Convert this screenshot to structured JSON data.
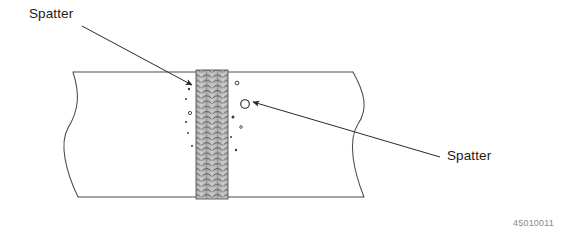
{
  "figure": {
    "id_number": "45010011",
    "colors": {
      "line": "#4a4a4a",
      "bead_fill": "#c9c9c9",
      "bead_dark": "#6f6f6f",
      "spatter": "#3a3a3a",
      "label_text": "#1a1a1a",
      "id_text": "#8a8a8a",
      "background": "#ffffff"
    },
    "callouts": [
      {
        "name": "spatter-top",
        "label": "Spatter",
        "label_x": 29,
        "label_y": 6,
        "leader_from_x": 82,
        "leader_from_y": 26,
        "leader_to_x": 192,
        "leader_to_y": 85
      },
      {
        "name": "spatter-bottom",
        "label": "Spatter",
        "label_x": 447,
        "label_y": 148,
        "leader_from_x": 440,
        "leader_from_y": 157,
        "leader_to_x": 245,
        "leader_to_y": 104
      }
    ],
    "plate": {
      "top_edge_y": 72,
      "bottom_edge_y": 197,
      "left_break_x": 68,
      "right_break_x": 358
    },
    "weld_bead": {
      "x": 196,
      "width": 32,
      "top_y": 70,
      "bottom_y": 199,
      "columns": 3,
      "rows": 26
    },
    "spatter_marks": [
      {
        "cx": 189,
        "cy": 89,
        "r": 1.2
      },
      {
        "cx": 186,
        "cy": 99,
        "r": 1.0
      },
      {
        "cx": 190,
        "cy": 113,
        "r": 1.6
      },
      {
        "cx": 186,
        "cy": 122,
        "r": 1.1
      },
      {
        "cx": 188,
        "cy": 133,
        "r": 0.9
      },
      {
        "cx": 192,
        "cy": 146,
        "r": 1.0
      },
      {
        "cx": 237,
        "cy": 83,
        "r": 1.9
      },
      {
        "cx": 245,
        "cy": 104,
        "r": 4.3
      },
      {
        "cx": 233,
        "cy": 117,
        "r": 1.5
      },
      {
        "cx": 241,
        "cy": 127,
        "r": 1.3
      },
      {
        "cx": 231,
        "cy": 137,
        "r": 1.0
      },
      {
        "cx": 236,
        "cy": 150,
        "r": 1.2
      }
    ]
  }
}
